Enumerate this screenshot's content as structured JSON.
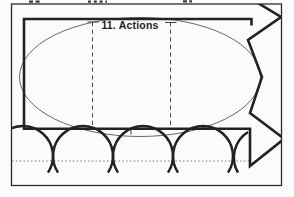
{
  "document": {
    "kind": "scanned line drawing fragment",
    "label": {
      "text": "11. Actions"
    }
  },
  "shapes": {
    "outer_border": "thin rectangular frame",
    "callout_ellipse": "large thin ellipse containing the label",
    "thick_panel": "bold partial rectangle behind the ellipse",
    "starburst": "jagged burst shape clipped at right edge",
    "loops": "row of four full coil loops plus one partial loop",
    "dashed_guides": "two vertical dashed fold lines with end ticks",
    "dotted_baseline": "horizontal dotted line through the loops"
  },
  "colors": {
    "ink": "#222222",
    "thin_line": "#565656",
    "guide_line": "#4a4a4a",
    "dotted_line": "#757575",
    "fragment_ink": "#3c3c3c",
    "paper": "#fbfbfa"
  }
}
